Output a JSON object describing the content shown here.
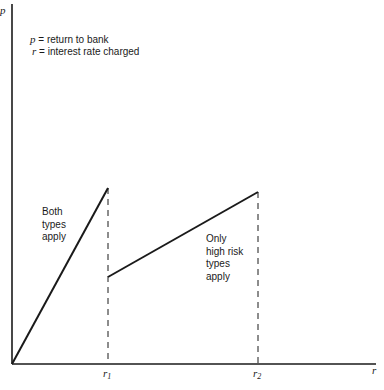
{
  "diagram": {
    "y_axis_label": "p",
    "x_axis_label": "r",
    "legend": {
      "line1_var": "p",
      "line1_text": " = return to bank",
      "line2_var": "r",
      "line2_text": " = interest rate charged"
    },
    "ticks": {
      "r1_base": "r",
      "r1_sub": "1",
      "r2_base": "r",
      "r2_sub": "2"
    },
    "region_labels": {
      "both": [
        "Both",
        "types",
        "apply"
      ],
      "only_high": [
        "Only",
        "high risk",
        "types",
        "apply"
      ]
    },
    "colors": {
      "line": "#1a1a1a",
      "background": "#ffffff"
    }
  }
}
